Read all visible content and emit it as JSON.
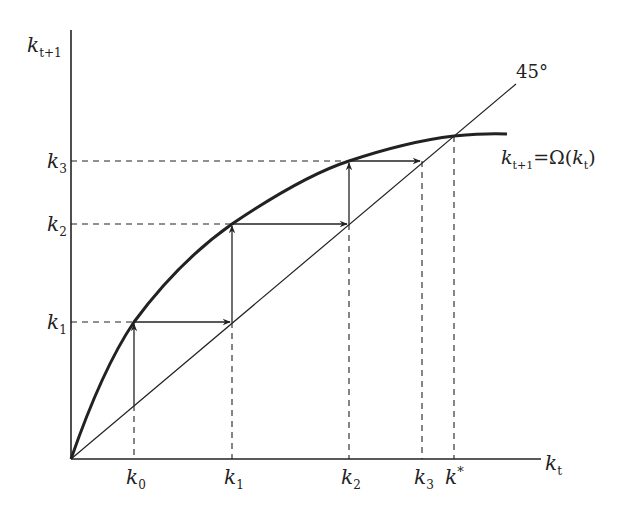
{
  "diagram": {
    "axes": {
      "y_label": {
        "base": "k",
        "sub": "t+1"
      },
      "x_label": {
        "base": "k",
        "sub": "t"
      }
    },
    "line_45_label": "45°",
    "curve_label": {
      "lhs_base": "k",
      "lhs_sub": "t+1",
      "eq": "=Ω(",
      "rhs_base": "k",
      "rhs_sub": "t",
      "close": ")"
    },
    "x_ticks": [
      {
        "base": "k",
        "sub": "0"
      },
      {
        "base": "k",
        "sub": "1"
      },
      {
        "base": "k",
        "sub": "2"
      },
      {
        "base": "k",
        "sub": "3"
      },
      {
        "base": "k",
        "sup": "*"
      }
    ],
    "y_ticks": [
      {
        "base": "k",
        "sub": "1"
      },
      {
        "base": "k",
        "sub": "2"
      },
      {
        "base": "k",
        "sub": "3"
      }
    ],
    "colors": {
      "ink": "#222222",
      "background": "#ffffff"
    }
  }
}
